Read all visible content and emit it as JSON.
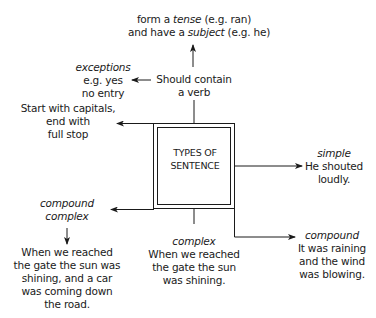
{
  "title": "TYPES OF SENTENCE",
  "center": {
    "lines": [
      "TYPES",
      "OF",
      "SENTENCE"
    ]
  },
  "nodes": {
    "verb": {
      "lines": [
        "Should contain",
        "a verb"
      ]
    },
    "tense": {
      "line1_pre": "form a ",
      "line1_em": "tense",
      "line1_post": " (e.g. ran)",
      "line2_pre": "and have a ",
      "line2_em": "subject",
      "line2_post": " (e.g. he)"
    },
    "exceptions": {
      "label": "exceptions",
      "lines": [
        "e.g. yes",
        "no entry"
      ]
    },
    "capitals": {
      "lines": [
        "Start with capitals,",
        "end with",
        "full stop"
      ]
    },
    "simple": {
      "label": "simple",
      "lines": [
        "He shouted",
        "loudly."
      ]
    },
    "compound_complex": {
      "label_lines": [
        "compound",
        "complex"
      ],
      "lines": [
        "When we reached",
        "the gate the sun was",
        "shining, and a car",
        "was coming down",
        "the road."
      ]
    },
    "complex": {
      "label": "complex",
      "lines": [
        "When we reached",
        "the gate the sun",
        "was shining."
      ]
    },
    "compound": {
      "label": "compound",
      "lines": [
        "It was raining",
        "and the wind",
        "was blowing."
      ]
    }
  },
  "colors": {
    "line": "#1a1a1a",
    "text": "#1a1a1a",
    "background": "#ffffff"
  }
}
